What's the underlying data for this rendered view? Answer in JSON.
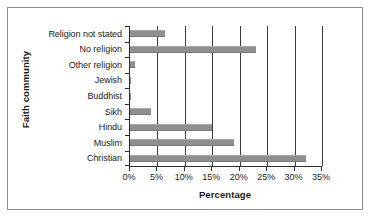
{
  "chart_data": {
    "type": "bar",
    "orientation": "horizontal",
    "title": "",
    "xlabel": "Percentage",
    "ylabel": "Faith community",
    "categories": [
      "Religion not stated",
      "No religion",
      "Other religion",
      "Jewish",
      "Buddhist",
      "Sikh",
      "Hindu",
      "Muslim",
      "Christian"
    ],
    "values": [
      6.3,
      23.0,
      0.9,
      0.1,
      0.1,
      3.9,
      15.0,
      19.0,
      32.0
    ],
    "xlim": [
      0,
      35
    ],
    "xtick_values": [
      0,
      5,
      10,
      15,
      20,
      25,
      30,
      35
    ],
    "xtick_labels": [
      "0%",
      "5%",
      "10%",
      "15%",
      "20%",
      "25%",
      "30%",
      "35%"
    ],
    "grid": "vertical",
    "legend": "none",
    "bar_color": "#8f8f8f",
    "axis_color": "#2b2b2b",
    "gridline_color": "#3a3a3a",
    "frame_border_color": "#8c8c8c",
    "background_color": "#ffffff"
  }
}
